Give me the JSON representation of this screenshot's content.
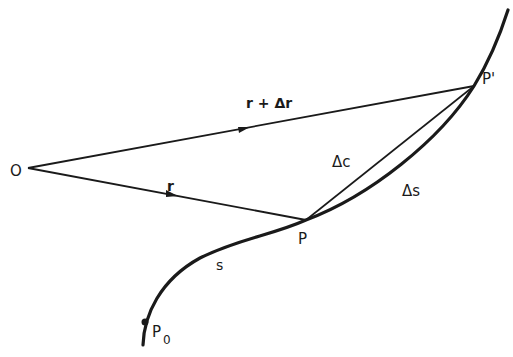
{
  "diagram": {
    "type": "vector-arc-chord",
    "labels": {
      "origin": "O",
      "point_p": "P",
      "point_p_prime": "P'",
      "point_p0": "P",
      "point_p0_sub": "0",
      "vector_r": "r",
      "vector_r_plus_dr": "r + Δr",
      "chord": "Δc",
      "arc": "Δs",
      "arc_length": "s"
    },
    "points": {
      "O": [
        28,
        168
      ],
      "P": [
        306,
        220
      ],
      "P_prime": [
        474,
        86
      ],
      "P0": [
        146,
        322
      ]
    },
    "colors": {
      "ink": "#1a1a1a",
      "background": "#ffffff"
    }
  }
}
